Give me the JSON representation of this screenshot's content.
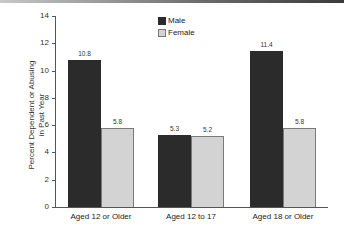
{
  "chart_data": {
    "type": "bar",
    "title": "",
    "xlabel": "",
    "ylabel": "Percent Dependent or Abusing in Past Year",
    "ylabel_lines": [
      "Percent Dependent or Abusing",
      "in Past Year"
    ],
    "ylim": [
      0,
      14
    ],
    "yticks": [
      0,
      2,
      4,
      6,
      8,
      10,
      12,
      14
    ],
    "grid": false,
    "legend_position": "top-center",
    "categories": [
      "Aged 12 or Older",
      "Aged 12 to 17",
      "Aged 18 or Older"
    ],
    "series": [
      {
        "name": "Male",
        "color": "#2b2b2b",
        "values": [
          10.8,
          5.3,
          11.4
        ],
        "labels": [
          "10.8",
          "5.3",
          "11.4"
        ]
      },
      {
        "name": "Female",
        "color": "#d3d3d3",
        "values": [
          5.8,
          5.2,
          5.8
        ],
        "labels": [
          "5.8",
          "5.2",
          "5.8"
        ]
      }
    ]
  }
}
